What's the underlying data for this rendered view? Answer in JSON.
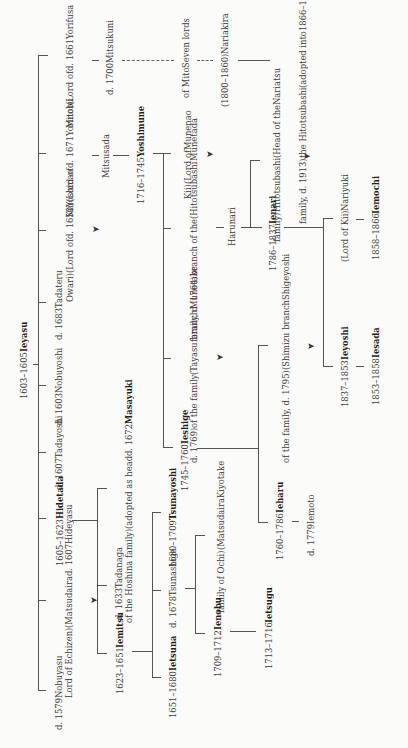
{
  "colors": {
    "ink": "#333333",
    "paper": "#fbfbf9"
  },
  "nodes": {
    "ieyasu": {
      "name": "Ieyasu",
      "lines": [
        "1603–1605"
      ],
      "shogun": true
    },
    "yorifusa": {
      "name": "Yorifusa",
      "lines": [
        "d. 1661",
        "(Lord of",
        "Mito)"
      ]
    },
    "mitsukuni": {
      "name": "Mitsukuni",
      "lines": [
        "d. 1700"
      ]
    },
    "seven_lords": {
      "name": "Seven lords",
      "lines": [
        "of Mito"
      ]
    },
    "nariakira": {
      "name": "Nariakira",
      "lines": [
        "(1800–1860)"
      ]
    },
    "yoshinobu": {
      "name": "Yoshinobu",
      "name2": "or Keiki",
      "lines": [
        "1866–1867",
        "(adopted into",
        "the Hitotsubashi",
        "family, d. 1913)"
      ],
      "shogun": true
    },
    "yorinobu": {
      "name": "Yorinobu",
      "lines": [
        "d. 1671",
        "(Lord of",
        "Kii)"
      ]
    },
    "mitsusada": {
      "name": "Mitsusada",
      "lines": []
    },
    "yoshimune": {
      "name": "Yoshimune",
      "lines": [
        "1716–1745"
      ],
      "shogun": true
    },
    "munenao": {
      "name": "Munenao",
      "lines": [
        "(Lord of",
        "Kii)"
      ]
    },
    "yoshinao": {
      "name": "Yoshinao",
      "lines": [
        "d. 1650",
        "(Lord of",
        "Owari)"
      ]
    },
    "munetada": {
      "name": "Munetada",
      "lines": [
        "(Hitotsubashi",
        "branch of the",
        "family, d. 1764)"
      ]
    },
    "harunari": {
      "name": "Harunari",
      "lines": []
    },
    "nariatsu": {
      "name": "Nariatsu",
      "lines": [
        "(Head of the",
        "Hitotsubashi",
        "family)"
      ]
    },
    "ienari": {
      "name": "Ienari",
      "lines": [
        "1786–1837"
      ],
      "shogun": true
    },
    "nariyuki": {
      "name": "Nariyuki",
      "lines": [
        "(Lord of Kii)"
      ]
    },
    "iemochi": {
      "name": "Iemochi",
      "lines": [
        "1858–1866"
      ],
      "shogun": true
    },
    "tadateru": {
      "name": "Tadateru",
      "lines": [
        "d. 1683"
      ]
    },
    "nobuyoshi": {
      "name": "Nobuyoshi",
      "lines": [
        "d. 1603"
      ]
    },
    "munetake": {
      "name": "Munetake",
      "lines": [
        "(Tayasu branch",
        "of the family",
        "d. 1769)"
      ]
    },
    "shigeyoshi": {
      "name": "Shigeyoshi",
      "lines": [
        "(Shimizu branch",
        "of the family, d. 1795)"
      ]
    },
    "ieyoshi": {
      "name": "Ieyoshi",
      "lines": [
        "1837–1853"
      ],
      "shogun": true
    },
    "iesada": {
      "name": "Iesada",
      "lines": [
        "1853–1858"
      ],
      "shogun": true
    },
    "tadayoshi": {
      "name": "Tadayoshi",
      "lines": [
        "d. 1607"
      ]
    },
    "ieshige": {
      "name": "Ieshige",
      "lines": [
        "1745–1760"
      ],
      "shogun": true
    },
    "hidetada": {
      "name": "Hidetada",
      "lines": [
        "1605–1623"
      ],
      "shogun": true
    },
    "masayuki": {
      "name": "Masayuki",
      "lines": [
        "d. 1672",
        "(adopted as head",
        "of the Hoshina family)"
      ]
    },
    "tsunayoshi": {
      "name": "Tsunayoshi",
      "lines": [
        "1680–1709"
      ],
      "shogun": true
    },
    "kiyotake": {
      "name": "Kiyotake",
      "lines": [
        "(Matsudaira",
        "family of Ochi)"
      ]
    },
    "ieharu": {
      "name": "Ieharu",
      "lines": [
        "1760–1786"
      ],
      "shogun": true
    },
    "iemoto": {
      "name": "Iemoto",
      "lines": [
        "d. 1779"
      ]
    },
    "hideyasu": {
      "name": "Hideyasu",
      "lines": [
        "d. 1607",
        "(Matsudaira",
        "Lord of Echizen)"
      ]
    },
    "tadanaga": {
      "name": "Tadanaga",
      "lines": [
        "d. 1633"
      ]
    },
    "tsunashige": {
      "name": "Tsunashige",
      "lines": [
        "d. 1678"
      ]
    },
    "iemitsu": {
      "name": "Iemitsu",
      "lines": [
        "1623–1651"
      ],
      "shogun": true
    },
    "ietsuna": {
      "name": "Ietsuna",
      "lines": [
        "1651–1680"
      ],
      "shogun": true
    },
    "ienobu": {
      "name": "Ienobu",
      "lines": [
        "1709–1712"
      ],
      "shogun": true
    },
    "ietsugu": {
      "name": "Ietsugu",
      "lines": [
        "1713–1716"
      ],
      "shogun": true
    },
    "nobuyasu": {
      "name": "Nobuyasu",
      "lines": [
        "d. 1579"
      ]
    }
  },
  "icons": {
    "continuation": "➤"
  }
}
